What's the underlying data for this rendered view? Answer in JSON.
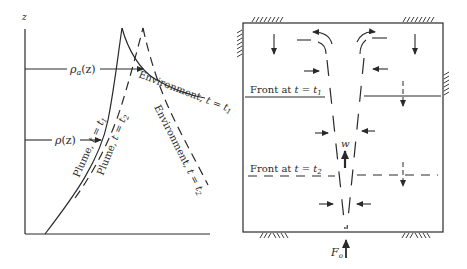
{
  "left_panel": {
    "axis_label_z": "z",
    "rho_a_label": "ρa(z)",
    "rho_a_main": "ρ",
    "rho_a_sub": "a",
    "rho_a_arg": "(z)",
    "rho_label_main": "ρ",
    "rho_label_arg": "(z)",
    "curves": {
      "plume_t1": "Plume, t = t1",
      "plume_t2": "Plume, t = t2",
      "env_t1": "Environment, t = t1",
      "env_t2": "Environment, t = t2"
    },
    "plume_t1_text": "Plume, ",
    "plume_t2_text": "Plume, ",
    "env_t1_text": "Environment, ",
    "env_t2_text": "Environment, ",
    "t_eq": "t = t",
    "sub1": "1",
    "sub2": "2"
  },
  "right_panel": {
    "front_t1_text": "Front at ",
    "front_t2_text": "Front at ",
    "t_eq": "t = t",
    "sub1": "1",
    "sub2": "2",
    "velocity_label": "w",
    "source_label_main": "F",
    "source_label_sub": "o"
  },
  "colors": {
    "ink": "#2a2a2a",
    "background": "#ffffff"
  }
}
